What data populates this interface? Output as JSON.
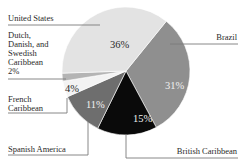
{
  "chart_data": {
    "type": "pie",
    "title": "",
    "categories": [
      "United States",
      "Brazil",
      "British Caribbean",
      "Spanish America",
      "French Caribbean",
      "Dutch, Danish, and Swedish Caribbean"
    ],
    "values": [
      36,
      31,
      15,
      11,
      4,
      2
    ],
    "unit": "%",
    "colors": [
      "#e3e3e3",
      "#8f8f8f",
      "#0a0a0a",
      "#6e6e6e",
      "#f3f3f3",
      "#b4b4b4"
    ],
    "pct_text_colors": [
      "#2a2a2a",
      "#f2f2f2",
      "#f2f2f2",
      "#f2f2f2",
      "#2a2a2a",
      ""
    ],
    "legend": "leader-line labels",
    "labels": {
      "united_states": "United States",
      "brazil": "Brazil",
      "british_caribbean": "British Caribbean",
      "spanish_america": "Spanish America",
      "french_caribbean_line1": "French",
      "french_caribbean_line2": "Caribbean",
      "dutch_line1": "Dutch,",
      "dutch_line2": "Danish, and",
      "dutch_line3": "Swedish",
      "dutch_line4": "Caribbean",
      "dutch_pct": "2%"
    },
    "pct_labels": {
      "united_states": "36%",
      "brazil": "31%",
      "british_caribbean": "15%",
      "spanish_america": "11%",
      "french_caribbean": "4%"
    }
  }
}
